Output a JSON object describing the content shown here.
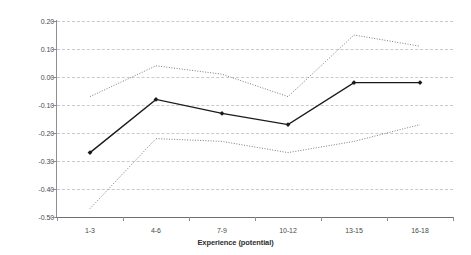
{
  "chart_data": {
    "type": "line",
    "title": "",
    "xlabel": "Experience (potential)",
    "ylabel": "",
    "categories": [
      "1-3",
      "4-6",
      "7-9",
      "10-12",
      "13-15",
      "16-18"
    ],
    "ylim": [
      -0.5,
      0.2
    ],
    "ytick_labels": [
      "0.20",
      "0.10",
      "0.00",
      "-0.10",
      "-0.20",
      "-0.30",
      "-0.40",
      "-0.50"
    ],
    "ytick_values": [
      0.2,
      0.1,
      0.0,
      -0.1,
      -0.2,
      -0.3,
      -0.4,
      -0.5
    ],
    "grid": true,
    "legend_position": "none",
    "series": [
      {
        "name": "estimate",
        "style": "solid",
        "marker": "diamond",
        "color": "#1a1a1a",
        "values": [
          -0.27,
          -0.08,
          -0.13,
          -0.17,
          -0.02,
          -0.02
        ]
      },
      {
        "name": "upper confidence bound",
        "style": "dotted",
        "marker": "none",
        "color": "#6e6e6e",
        "values": [
          -0.07,
          0.04,
          0.01,
          -0.07,
          0.15,
          0.11
        ]
      },
      {
        "name": "lower confidence bound",
        "style": "dotted",
        "marker": "none",
        "color": "#6e6e6e",
        "values": [
          -0.47,
          -0.22,
          -0.23,
          -0.27,
          -0.23,
          -0.17
        ]
      }
    ]
  },
  "axes": {
    "x_title": "Experience (potential)"
  },
  "clipped_title": ""
}
